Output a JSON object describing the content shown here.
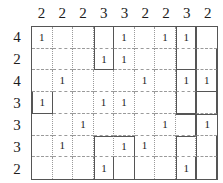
{
  "puzzle": {
    "type": "grid-logic-puzzle",
    "rows": 7,
    "cols": 9,
    "colors": {
      "text": "#1c1c1c",
      "region_border": "#555555",
      "cell_grid": "#9a9a9a",
      "background": "#ffffff"
    },
    "column_clues": [
      "2",
      "2",
      "2",
      "3",
      "3",
      "2",
      "2",
      "3",
      "2"
    ],
    "row_clues": [
      "4",
      "2",
      "4",
      "3",
      "3",
      "3",
      "2"
    ],
    "cells": [
      [
        "1",
        "",
        "",
        "",
        "1",
        "",
        "1",
        "1",
        ""
      ],
      [
        "",
        "",
        "",
        "1",
        "1",
        "",
        "",
        "",
        ""
      ],
      [
        "",
        "1",
        "",
        "",
        "",
        "1",
        "",
        "1",
        "1"
      ],
      [
        "1",
        "",
        "",
        "1",
        "1",
        "",
        "",
        "",
        ""
      ],
      [
        "",
        "",
        "1",
        "",
        "",
        "",
        "1",
        "",
        "1"
      ],
      [
        "",
        "1",
        "",
        "",
        "1",
        "1",
        "",
        "",
        ""
      ],
      [
        "",
        "",
        "",
        "1",
        "",
        "",
        "",
        "1",
        ""
      ]
    ],
    "region_edges": {
      "comment": "per-cell thick border flags: t=top r=right b=bottom l=left",
      "map": [
        [
          "",
          "",
          "",
          "lr",
          "",
          "",
          "",
          "lr",
          "l"
        ],
        [
          "",
          "",
          "",
          "lrb",
          "",
          "",
          "",
          "lrb",
          "lr"
        ],
        [
          "",
          "",
          "",
          "",
          "",
          "",
          "",
          "lr",
          "lrb"
        ],
        [
          "lrb",
          "",
          "",
          "",
          "",
          "",
          "",
          "lrb",
          "lr"
        ],
        [
          "",
          "",
          "",
          "",
          "",
          "",
          "",
          "tr",
          "lt"
        ],
        [
          "",
          "",
          "",
          "lt",
          "tr",
          "",
          "",
          "lt",
          "lr"
        ],
        [
          "",
          "",
          "",
          "lr",
          "r",
          "",
          "",
          "lr",
          "lr"
        ]
      ]
    }
  }
}
